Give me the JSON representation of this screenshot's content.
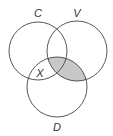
{
  "diagram": {
    "type": "venn",
    "sets": [
      {
        "name": "C",
        "cx": 38,
        "cy": 51,
        "r": 29,
        "label_x": 38,
        "label_y": 17
      },
      {
        "name": "V",
        "cx": 77,
        "cy": 51,
        "r": 30,
        "label_x": 77,
        "label_y": 17
      },
      {
        "name": "D",
        "cx": 57,
        "cy": 87,
        "r": 30,
        "label_x": 57,
        "label_y": 131
      }
    ],
    "region_labels": [
      {
        "text": "X",
        "x": 40,
        "y": 77,
        "region": "C∩D only"
      }
    ],
    "shaded_region": "V∩D",
    "shade_color": "#c8c8c8",
    "stroke_color": "#444444"
  }
}
